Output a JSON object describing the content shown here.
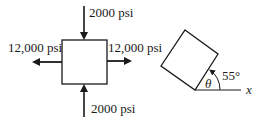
{
  "left_figure": {
    "top_load": "2000 psi",
    "bottom_load": "2000 psi",
    "left_load": "12,000 psi",
    "right_load": "12,000 psi"
  },
  "right_figure": {
    "angle_symbol": "θ",
    "angle_value": "55°",
    "axis_label": "x"
  },
  "colors": {
    "ink": "#1a1a1a",
    "background": "#ffffff"
  }
}
